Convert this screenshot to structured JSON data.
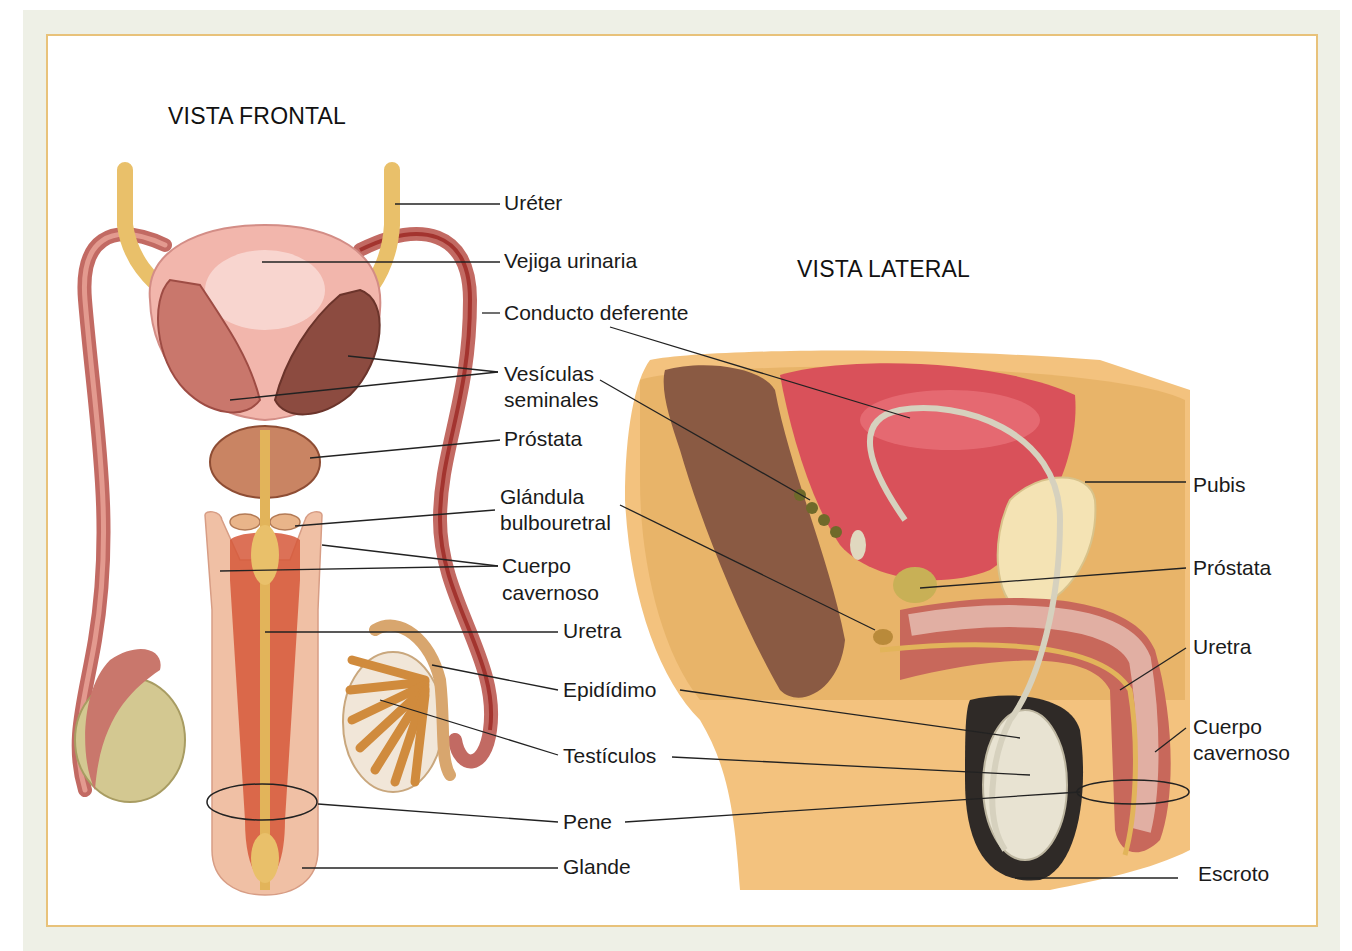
{
  "diagram": {
    "views": [
      {
        "id": "frontal",
        "title": "VISTA FRONTAL"
      },
      {
        "id": "lateral",
        "title": "VISTA LATERAL"
      }
    ],
    "frontal_labels": [
      "Uréter",
      "Vejiga urinaria",
      "Conducto deferente",
      "Vesículas seminales",
      "Próstata",
      "Glándula bulbouretral",
      "Cuerpo cavernoso",
      "Uretra",
      "Epidídimo",
      "Testículos",
      "Pene",
      "Glande"
    ],
    "lateral_labels": [
      "Pubis",
      "Próstata",
      "Uretra",
      "Cuerpo cavernoso",
      "Escroto"
    ],
    "labels": {
      "ureter": "Uréter",
      "vejiga": "Vejiga urinaria",
      "conducto": "Conducto deferente",
      "vesiculas_1": "Vesículas",
      "vesiculas_2": "seminales",
      "prostata": "Próstata",
      "glandula_1": "Glándula",
      "glandula_2": "bulbouretral",
      "cuerpo_1": "Cuerpo",
      "cuerpo_2": "cavernoso",
      "uretra": "Uretra",
      "epididimo": "Epidídimo",
      "testiculos": "Testículos",
      "pene": "Pene",
      "glande": "Glande",
      "pubis": "Pubis",
      "prostata_lat": "Próstata",
      "uretra_lat": "Uretra",
      "cuerpo_lat_1": "Cuerpo",
      "cuerpo_lat_2": "cavernoso",
      "escroto": "Escroto"
    },
    "colors": {
      "background": "#eef0e6",
      "frame_border": "#e8c27a",
      "ureter": "#e9c06a",
      "bladder": "#f0b0a8",
      "vas": "#c9706a",
      "testis": "#cfc48a",
      "fat": "#e8bd73",
      "bladder_lateral": "#d9515a",
      "rectum": "#8a5a43",
      "skin": "#f3c27e"
    }
  }
}
